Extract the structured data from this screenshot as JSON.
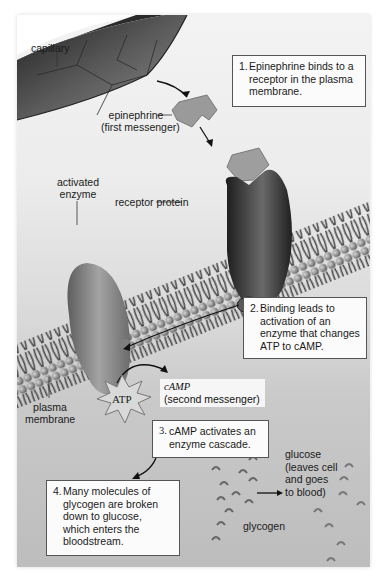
{
  "figure": {
    "labels": {
      "capillary": "capillary",
      "epinephrine_1": "epinephrine",
      "epinephrine_2": "(first messenger)",
      "activated_enzyme_1": "activated",
      "activated_enzyme_2": "enzyme",
      "receptor_protein": "receptor protein",
      "plasma_membrane_1": "plasma",
      "plasma_membrane_2": "membrane",
      "atp": "ATP",
      "camp": "cAMP",
      "second_messenger": "(second messenger)",
      "glucose_1": "glucose",
      "glucose_2": "(leaves cell",
      "glucose_3": "and goes",
      "glucose_4": "to blood)",
      "glycogen": "glycogen"
    },
    "steps": [
      {
        "number": "1.",
        "text": "Epinephrine binds to a\nreceptor in the plasma\nmembrane."
      },
      {
        "number": "2.",
        "text": "Binding leads to\nactivation of an\nenzyme that changes\nATP to cAMP."
      },
      {
        "number": "3.",
        "text": "cAMP activates an\nenzyme cascade."
      },
      {
        "number": "4.",
        "text": "Many molecules of\nglycogen are broken\ndown to glucose,\nwhich enters the\nbloodstream."
      }
    ],
    "colors": {
      "background_top": "#f3f3f3",
      "background_bottom": "#bdbdbd",
      "capillary": "#3a3a3a",
      "receptor": "#2e2e2e",
      "enzyme": "#8a8a8a",
      "epinephrine": "#9a9a9a",
      "box_border": "#555555"
    }
  }
}
